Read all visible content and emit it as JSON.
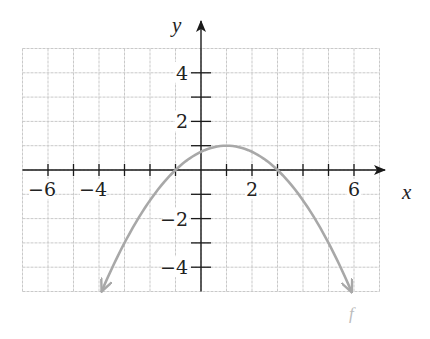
{
  "chart_data": {
    "type": "line",
    "title": "",
    "xlabel": "x",
    "ylabel": "y",
    "xlim": [
      -7,
      7
    ],
    "ylim": [
      -5,
      5
    ],
    "grid": true,
    "x_tick_labels": [
      "−6",
      "−4",
      "2",
      "6"
    ],
    "x_tick_values": [
      -6,
      -4,
      2,
      6
    ],
    "y_tick_labels": [
      "4",
      "2",
      "−2",
      "−4"
    ],
    "y_tick_values": [
      4,
      2,
      -2,
      -4
    ],
    "series": [
      {
        "name": "f",
        "function": "f(x) = -(1/4)(x + 1)(x - 3)",
        "vertex": [
          1,
          1
        ],
        "x_intercepts": [
          -1,
          3
        ],
        "y_intercept": 0.75,
        "domain_shown": [
          -4,
          6
        ],
        "arrows_on_ends": true,
        "x": [
          -4,
          -3,
          -2,
          -1,
          0,
          1,
          2,
          3,
          4,
          5,
          6
        ],
        "y": [
          -5.25,
          -3,
          -1.25,
          0,
          0.75,
          1,
          0.75,
          0,
          -1.25,
          -3,
          -5.25
        ],
        "color": "#a8a8a8"
      }
    ],
    "legend": "none",
    "annotations": [
      {
        "text": "f",
        "position": "near lower right arrow end"
      }
    ]
  },
  "labels": {
    "x_axis": "x",
    "y_axis": "y",
    "curve": "f",
    "x_ticks": [
      "−6",
      "−4",
      "2",
      "6"
    ],
    "y_ticks": [
      "4",
      "2",
      "−2",
      "−4"
    ]
  },
  "colors": {
    "grid": "#c9c9c9",
    "axes": "#1a1a1a",
    "curve": "#a8a8a8",
    "curve_label": "#bcbcbc"
  }
}
